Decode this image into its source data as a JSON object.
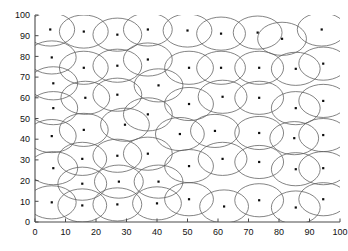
{
  "figure": {
    "title": "",
    "background_color": "#ffffff",
    "width": 348,
    "height": 251
  },
  "axes": {
    "frame_style": "L-shape (left and bottom spines only)",
    "axis_color": "#4a4a4a",
    "x": {
      "label": "",
      "min": 0,
      "max": 100,
      "tick_step": 10,
      "tick_labels": [
        "0",
        "10",
        "20",
        "30",
        "40",
        "50",
        "60",
        "70",
        "80",
        "90",
        "100"
      ]
    },
    "y": {
      "label": "",
      "min": 0,
      "max": 100,
      "tick_step": 10,
      "tick_labels": [
        "0",
        "10",
        "20",
        "30",
        "40",
        "50",
        "60",
        "70",
        "80",
        "90",
        "100"
      ]
    },
    "plot_area_px": {
      "left": 35,
      "top": 15,
      "right": 340,
      "bottom": 222
    }
  },
  "chart_data": {
    "type": "scatter",
    "title": "",
    "xlabel": "",
    "ylabel": "",
    "xlim": [
      0,
      100
    ],
    "ylim": [
      0,
      100
    ],
    "grid": false,
    "legend": null,
    "marker": {
      "shape": "square",
      "color": "#0d0d0d",
      "size_px": 2.2,
      "name": "sensor node"
    },
    "overlay": {
      "type": "circle",
      "name": "sensing coverage radius",
      "radius": 8,
      "stroke_color": "#5b5b5b",
      "stroke_width": 0.75,
      "fill": "none"
    },
    "points": [
      {
        "x": 5.0,
        "y": 93.0
      },
      {
        "x": 16.0,
        "y": 92.0
      },
      {
        "x": 27.0,
        "y": 90.5
      },
      {
        "x": 37.0,
        "y": 93.0
      },
      {
        "x": 50.0,
        "y": 92.5
      },
      {
        "x": 61.0,
        "y": 91.0
      },
      {
        "x": 73.0,
        "y": 91.5
      },
      {
        "x": 81.0,
        "y": 88.5
      },
      {
        "x": 94.0,
        "y": 93.0
      },
      {
        "x": 5.5,
        "y": 79.5
      },
      {
        "x": 16.0,
        "y": 74.5
      },
      {
        "x": 27.0,
        "y": 75.5
      },
      {
        "x": 37.0,
        "y": 78.5
      },
      {
        "x": 50.5,
        "y": 74.5
      },
      {
        "x": 61.0,
        "y": 74.5
      },
      {
        "x": 73.5,
        "y": 74.5
      },
      {
        "x": 85.5,
        "y": 74.0
      },
      {
        "x": 94.5,
        "y": 76.5
      },
      {
        "x": 6.0,
        "y": 67.0
      },
      {
        "x": 16.5,
        "y": 60.0
      },
      {
        "x": 27.0,
        "y": 61.5
      },
      {
        "x": 40.5,
        "y": 66.0
      },
      {
        "x": 50.5,
        "y": 57.0
      },
      {
        "x": 61.5,
        "y": 60.5
      },
      {
        "x": 73.5,
        "y": 60.0
      },
      {
        "x": 85.5,
        "y": 55.0
      },
      {
        "x": 94.5,
        "y": 58.5
      },
      {
        "x": 6.0,
        "y": 55.0
      },
      {
        "x": 16.0,
        "y": 44.5
      },
      {
        "x": 29.5,
        "y": 47.0
      },
      {
        "x": 37.0,
        "y": 52.0
      },
      {
        "x": 47.5,
        "y": 42.5
      },
      {
        "x": 59.0,
        "y": 44.0
      },
      {
        "x": 73.5,
        "y": 43.0
      },
      {
        "x": 85.0,
        "y": 40.5
      },
      {
        "x": 94.5,
        "y": 42.0
      },
      {
        "x": 5.5,
        "y": 41.5
      },
      {
        "x": 15.5,
        "y": 30.5
      },
      {
        "x": 27.0,
        "y": 32.0
      },
      {
        "x": 37.0,
        "y": 33.0
      },
      {
        "x": 50.5,
        "y": 27.0
      },
      {
        "x": 61.5,
        "y": 30.5
      },
      {
        "x": 73.5,
        "y": 29.0
      },
      {
        "x": 85.5,
        "y": 25.5
      },
      {
        "x": 94.5,
        "y": 26.0
      },
      {
        "x": 6.0,
        "y": 26.0
      },
      {
        "x": 15.5,
        "y": 18.5
      },
      {
        "x": 27.5,
        "y": 19.5
      },
      {
        "x": 40.5,
        "y": 19.5
      },
      {
        "x": 50.5,
        "y": 11.0
      },
      {
        "x": 62.0,
        "y": 7.5
      },
      {
        "x": 73.5,
        "y": 10.5
      },
      {
        "x": 85.5,
        "y": 7.0
      },
      {
        "x": 94.5,
        "y": 11.0
      },
      {
        "x": 5.5,
        "y": 9.5
      },
      {
        "x": 15.5,
        "y": 8.0
      },
      {
        "x": 27.0,
        "y": 8.5
      },
      {
        "x": 40.0,
        "y": 9.0
      }
    ]
  }
}
